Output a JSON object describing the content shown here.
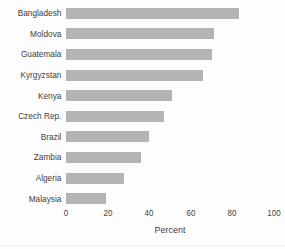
{
  "chart_data": {
    "type": "bar",
    "orientation": "horizontal",
    "categories": [
      "Bangladesh",
      "Moldova",
      "Guatemala",
      "Kyrgyzstan",
      "Kenya",
      "Czech Rep.",
      "Brazil",
      "Zambia",
      "Algeria",
      "Malaysia"
    ],
    "values": [
      83,
      71,
      70,
      66,
      51,
      47,
      40,
      36,
      28,
      19
    ],
    "title": "",
    "xlabel": "Percent",
    "ylabel": "",
    "xlim": [
      0,
      100
    ],
    "xticks": [
      0,
      20,
      40,
      60,
      80,
      100
    ],
    "grid": false,
    "legend": false,
    "bar_color": "#b4b4b4",
    "text_color": "#3d3d3d",
    "background_color": "#fdfdfe"
  }
}
